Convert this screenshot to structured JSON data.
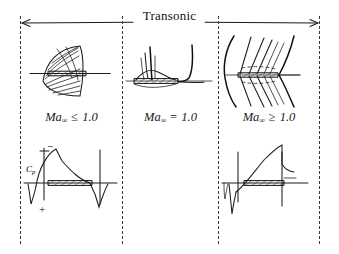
{
  "figure": {
    "kind": "transonic-flow-regimes-diagram",
    "title": "Transonic",
    "background_color": "#ffffff",
    "ink_color": "#1a1a1a",
    "divider_style": "dashed",
    "divider_color": "#3b3b3b"
  },
  "header": {
    "span_label": "Transonic",
    "left_arrow": "left-arrowhead",
    "right_arrow": "right-arrowhead"
  },
  "panels": [
    {
      "id": "subsonic",
      "label_prefix": "Ma",
      "label_subscript": "∞",
      "label_relation": "≤",
      "label_value": "1.0",
      "flow_sketch": "airfoil with lens-shaped subsonic field and radiating streamlines",
      "cp_plot": {
        "axis_label": "C",
        "axis_label_sub": "p",
        "sign_top": "−",
        "sign_bottom": "+",
        "curve": "smooth rounded suction dome, no shock"
      }
    },
    {
      "id": "sonic",
      "label_prefix": "Ma",
      "label_subscript": "∞",
      "label_relation": "=",
      "label_value": "1.0",
      "flow_sketch": "airfoil with vertical sonic line and downstream curved sonic boundary",
      "cp_plot": null
    },
    {
      "id": "supersonic",
      "label_prefix": "Ma",
      "label_subscript": "∞",
      "label_relation": "≥",
      "label_value": "1.0",
      "flow_sketch": "detached bow shock ahead of airfoil with oblique Mach waves and trailing shock",
      "cp_plot": {
        "axis_label": "",
        "axis_label_sub": "",
        "sign_top": "",
        "sign_bottom": "",
        "curve": "rising suction ramp terminated by sharp trailing-edge shock drop"
      }
    }
  ]
}
